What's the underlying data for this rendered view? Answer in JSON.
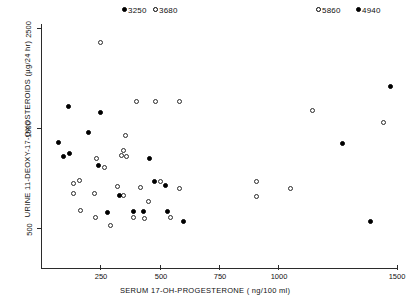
{
  "chart_data": {
    "type": "scatter",
    "title": "",
    "xlabel": "SERUM   17-OH-PROGESTERONE      ( ng/100 ml)",
    "xlabel_name": "SERUM   17-OH-PROGESTERONE",
    "xlabel_units": "( ng/100 ml)",
    "ylabel": "URINE  11-DEOXY-17-OXOSTEROIDS  (µg/24 hr)",
    "ylabel_name": "URINE  11-DEOXY-17-OXOSTEROIDS",
    "ylabel_units": "(µg/24 hr)",
    "xlim": [
      0,
      1500
    ],
    "ylim": [
      0,
      2700
    ],
    "xticks": [
      250,
      500,
      750,
      1000,
      1500
    ],
    "xtick_labels": [
      "250",
      "500",
      "750",
      "1000",
      "1500"
    ],
    "yticks": [
      500,
      1500,
      2500
    ],
    "ytick_labels": [
      "500",
      "1500",
      "2500"
    ],
    "grid": false,
    "legend": null,
    "marker_colors": {
      "filled": "#000000",
      "open": "#ffffff",
      "open_edge": "#2a2a2a"
    },
    "series": [
      {
        "name": "open-circles",
        "marker": "open",
        "points": [
          [
            250,
            2500
          ],
          [
            400,
            1840
          ],
          [
            480,
            1840
          ],
          [
            580,
            1840
          ],
          [
            355,
            1470
          ],
          [
            345,
            1305
          ],
          [
            340,
            1240
          ],
          [
            360,
            1235
          ],
          [
            235,
            1210
          ],
          [
            265,
            1110
          ],
          [
            160,
            965
          ],
          [
            500,
            960
          ],
          [
            135,
            930
          ],
          [
            320,
            905
          ],
          [
            420,
            890
          ],
          [
            580,
            880
          ],
          [
            135,
            820
          ],
          [
            225,
            825
          ],
          [
            345,
            805
          ],
          [
            450,
            740
          ],
          [
            165,
            640
          ],
          [
            230,
            560
          ],
          [
            290,
            470
          ],
          [
            390,
            555
          ],
          [
            435,
            545
          ],
          [
            545,
            555
          ],
          [
            1140,
            1740
          ],
          [
            1440,
            1610
          ],
          [
            905,
            955
          ],
          [
            1050,
            880
          ],
          [
            905,
            795
          ]
        ]
      },
      {
        "name": "filled-circles",
        "marker": "filled",
        "points": [
          [
            115,
            1790
          ],
          [
            250,
            1725
          ],
          [
            200,
            1500
          ],
          [
            75,
            1385
          ],
          [
            120,
            1270
          ],
          [
            95,
            1230
          ],
          [
            240,
            1130
          ],
          [
            455,
            1215
          ],
          [
            475,
            960
          ],
          [
            525,
            915
          ],
          [
            330,
            805
          ],
          [
            280,
            610
          ],
          [
            390,
            620
          ],
          [
            430,
            630
          ],
          [
            530,
            620
          ],
          [
            600,
            510
          ],
          [
            1470,
            2010
          ],
          [
            1265,
            1380
          ],
          [
            1385,
            520
          ]
        ]
      }
    ],
    "callouts": [
      {
        "marker": "filled",
        "label": "3250",
        "x_px": 124,
        "y_px": 10
      },
      {
        "marker": "open",
        "label": "3680",
        "x_px": 155,
        "y_px": 10
      },
      {
        "marker": "open",
        "label": "5860",
        "x_px": 318,
        "y_px": 10
      },
      {
        "marker": "filled",
        "label": "4940",
        "x_px": 358,
        "y_px": 10
      }
    ]
  },
  "plot_geometry": {
    "left_px": 41,
    "right_px": 398,
    "top_px": 24,
    "bottom_px": 268,
    "x_min": 0,
    "x_max": 1500,
    "y_min": 0,
    "y_max": 2700
  }
}
